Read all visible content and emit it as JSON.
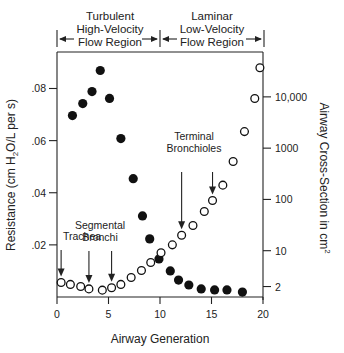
{
  "chart_data": {
    "type": "scatter",
    "title": "",
    "xlabel": "Airway Generation",
    "ylabel": "Resistance (cm H2O/L per s)",
    "ylabel_parts": [
      "Resistance (cm H",
      "2",
      "O/L per s)"
    ],
    "y2label": "Airway Cross-Section in cm",
    "y2label_sup": "2",
    "xlim": [
      0,
      20
    ],
    "ylim": [
      0,
      0.094
    ],
    "y2scale": "log",
    "y2lim": [
      1.25,
      75000
    ],
    "xticks": [
      0,
      5,
      10,
      15,
      20
    ],
    "xtick_labels": [
      "0",
      "5",
      "10",
      "15",
      "20"
    ],
    "yticks": [
      0.02,
      0.04,
      0.06,
      0.08
    ],
    "ytick_labels": [
      ".02",
      ".04",
      ".06",
      ".08"
    ],
    "y2ticks": [
      2,
      10,
      100,
      1000,
      10000
    ],
    "y2tick_labels": [
      "2",
      "10",
      "100",
      "1000",
      "10,000"
    ],
    "grid": false,
    "regions": [
      {
        "lines": [
          "Turbulent",
          "High-Velocity",
          "Flow Region"
        ],
        "x_range": [
          0,
          10
        ]
      },
      {
        "lines": [
          "Laminar",
          "Low-Velocity",
          "Flow Region"
        ],
        "x_range": [
          10,
          20
        ]
      }
    ],
    "series": [
      {
        "name": "Resistance",
        "marker": "filled-circle",
        "axis": "left",
        "x": [
          1.5,
          2.5,
          3.4,
          4.2,
          5.1,
          6.2,
          7.4,
          8.3,
          9.0,
          9.9,
          11.0,
          11.8,
          12.8,
          14.0,
          15.3,
          16.5,
          18.0
        ],
        "y": [
          0.0696,
          0.0742,
          0.0788,
          0.0869,
          0.0762,
          0.0608,
          0.0454,
          0.0311,
          0.0223,
          0.0146,
          0.01,
          0.0065,
          0.0046,
          0.0031,
          0.0027,
          0.0027,
          0.0019
        ]
      },
      {
        "name": "Airway Cross-Section",
        "marker": "open-circle",
        "axis": "right",
        "x": [
          0.4,
          1.3,
          2.3,
          3.1,
          4.4,
          5.3,
          6.2,
          7.2,
          8.2,
          9.1,
          10.1,
          11.2,
          12.1,
          13.2,
          14.3,
          15.1,
          16.1,
          17.1,
          18.2,
          19.2,
          19.7
        ],
        "y": [
          2.4,
          2.2,
          2.0,
          1.8,
          1.7,
          1.9,
          2.2,
          3.0,
          4.1,
          5.9,
          9.1,
          13,
          20,
          31,
          58,
          95,
          190,
          550,
          2100,
          9300,
          37000
        ]
      }
    ],
    "annotations": [
      {
        "lines": [
          "Trachea"
        ],
        "arrows": [
          {
            "x": 0.4,
            "axis": "right",
            "y": 2.4
          }
        ]
      },
      {
        "lines": [
          "Segmental",
          "Bronchi"
        ],
        "arrows": [
          {
            "x": 3.1,
            "axis": "right",
            "y": 1.8
          },
          {
            "x": 5.3,
            "axis": "right",
            "y": 1.9
          }
        ]
      },
      {
        "lines": [
          "Terminal",
          "Bronchioles"
        ],
        "arrows": [
          {
            "x": 12.1,
            "axis": "right",
            "y": 20
          },
          {
            "x": 15.1,
            "axis": "right",
            "y": 95
          }
        ]
      }
    ]
  }
}
